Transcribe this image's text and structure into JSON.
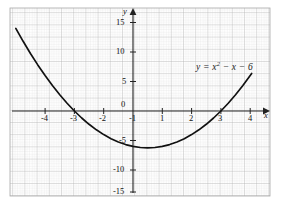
{
  "figure": {
    "kind": "graph-paper-plot",
    "background_color": "#ffffff",
    "grid_minor_color": "#d8d8d8",
    "grid_major_color": "#b5b5b5",
    "grid_border_color": "#a8a8a8",
    "axis_color": "#222222",
    "curve_color": "#111111",
    "grid_rect": {
      "x": 10,
      "y": 8,
      "width": 260,
      "height": 188
    }
  },
  "chart_data": {
    "type": "line",
    "title": "",
    "subtitle": "",
    "xlabel": "x",
    "ylabel": "y",
    "equation_label": "y = x² − x − 6",
    "equation_parts": {
      "lhs": "y",
      "eq": "=",
      "x_sym": "x",
      "power": "2",
      "rest": "− x − 6"
    },
    "function": "y = x^2 - x - 6",
    "xlim": [
      -4.2,
      4.3
    ],
    "ylim": [
      -16.2,
      16.0
    ],
    "grid": true,
    "legend": "none",
    "x_ticks": [
      -4,
      -3,
      -2,
      -1,
      0,
      1,
      2,
      3,
      4
    ],
    "x_tick_labels": [
      "-4",
      "-3",
      "-2",
      "-1",
      "0",
      "1",
      "2",
      "3",
      "4"
    ],
    "y_ticks": [
      -15,
      -10,
      -5,
      5,
      10,
      15
    ],
    "y_tick_labels": [
      "-15",
      "-10",
      "-5",
      "5",
      "10",
      "15"
    ],
    "origin_label": "0",
    "x_domain_drawn": [
      -4.0,
      4.05
    ],
    "roots": [
      -2,
      3
    ],
    "vertex": {
      "x": 0.5,
      "y": -6.25
    },
    "y_intercept": -6,
    "x": [
      -4.0,
      -3.75,
      -3.5,
      -3.25,
      -3.0,
      -2.75,
      -2.5,
      -2.25,
      -2.0,
      -1.75,
      -1.5,
      -1.25,
      -1.0,
      -0.75,
      -0.5,
      -0.25,
      0.0,
      0.25,
      0.5,
      0.75,
      1.0,
      1.25,
      1.5,
      1.75,
      2.0,
      2.25,
      2.5,
      2.75,
      3.0,
      3.25,
      3.5,
      3.75,
      4.0,
      4.05
    ],
    "y": [
      14.0,
      11.8125,
      9.75,
      7.8125,
      6.0,
      4.3125,
      2.75,
      1.3125,
      0.0,
      -1.1875,
      -2.25,
      -3.1875,
      -4.0,
      -4.6875,
      -5.25,
      -5.6875,
      -6.0,
      -6.1875,
      -6.25,
      -6.1875,
      -6.0,
      -5.6875,
      -5.25,
      -4.6875,
      -4.0,
      -3.1875,
      -2.25,
      -1.1875,
      0.0,
      1.3125,
      2.75,
      4.3125,
      6.0,
      6.3525
    ]
  }
}
